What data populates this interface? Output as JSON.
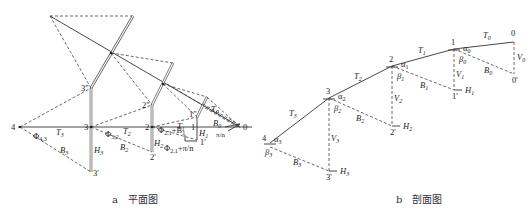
{
  "figure": {
    "panel_a": {
      "caption_letter": "a",
      "caption_text": "平面图",
      "points": {
        "p0": "0",
        "p1": "1",
        "p2": "2",
        "p3": "3",
        "p4": "4",
        "p1p": "1'",
        "p1pp": "1\"",
        "p2p": "2'",
        "p2pp": "2\"",
        "p3p": "3'",
        "p3pp": "3\""
      },
      "tangents": {
        "t0": "T",
        "t0s": "0",
        "t1": "T",
        "t1s": "1",
        "t2": "T",
        "t2s": "2",
        "t3": "T",
        "t3s": "3"
      },
      "offsets": {
        "b0": "B",
        "b0s": "0",
        "b1": "B",
        "b1s": "1",
        "b2": "B",
        "b2s": "2",
        "b3": "B",
        "b3s": "3"
      },
      "heights": {
        "h1": "H",
        "h1s": "1",
        "h2": "H",
        "h2s": "2",
        "h3": "H",
        "h3s": "3"
      },
      "angles": {
        "phi43": "Φ",
        "phi43s": "4,3",
        "phi32": "Φ",
        "phi32s": "3,2",
        "phi21a": "Φ",
        "phi21as": "2,1",
        "phi21a_suffix": "+B",
        "phi21a_suffix_sub": "1",
        "phi21b": "Φ",
        "phi21bs": "2,1",
        "phi21b_suffix": "+π/n",
        "pin": "π/n"
      }
    },
    "panel_b": {
      "caption_letter": "b",
      "caption_text": "剖面图",
      "points": {
        "p0": "0",
        "p1": "1",
        "p2": "2",
        "p3": "3",
        "p4": "4",
        "p0p": "0'",
        "p1p": "1'",
        "p2p": "2'",
        "p3p": "3'"
      },
      "tangents": {
        "t0": "T",
        "t0s": "0",
        "t1": "T",
        "t1s": "1",
        "t2": "T",
        "t2s": "2",
        "t3": "T",
        "t3s": "3"
      },
      "offsets": {
        "b0": "B",
        "b0s": "0",
        "b1": "B",
        "b1s": "1",
        "b2": "B",
        "b2s": "2",
        "b3": "B",
        "b3s": "3"
      },
      "verticals": {
        "v0": "V",
        "v0s": "0",
        "v1": "V",
        "v1s": "1",
        "v2": "V",
        "v2s": "2",
        "v3": "V",
        "v3s": "3"
      },
      "heights": {
        "h1": "H",
        "h1s": "1",
        "h2": "H",
        "h2s": "2",
        "h3": "H",
        "h3s": "3"
      },
      "alphas": {
        "a0": "α",
        "a0s": "0",
        "a1": "α",
        "a1s": "1",
        "a2": "α",
        "a2s": "2",
        "a3": "α",
        "a3s": "3"
      },
      "betas": {
        "b0": "β",
        "b0s": "0",
        "b1": "β",
        "b1s": "1",
        "b2": "β",
        "b2s": "2",
        "b3": "β",
        "b3s": "3"
      }
    }
  }
}
